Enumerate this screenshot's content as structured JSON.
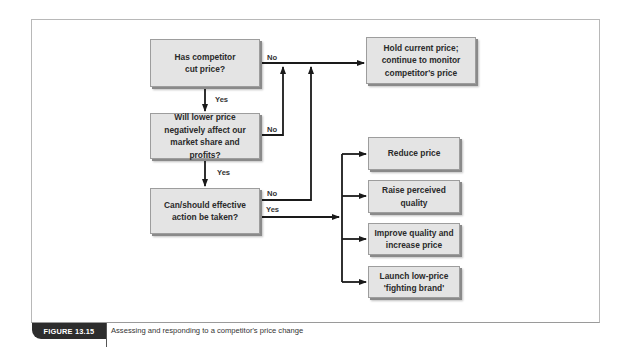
{
  "figure": {
    "label": "FIGURE 13.15",
    "caption": "Assessing and responding to a competitor's price change"
  },
  "nodes": {
    "q1": "Has competitor cut price?",
    "q2": "Will lower price negatively affect our market share and profits?",
    "q3": "Can/should effective action be taken?",
    "hold": "Hold current price; continue to monitor competitor's price",
    "reduce": "Reduce price",
    "raise": "Raise perceived quality",
    "improve": "Improve quality and increase price",
    "launch": "Launch low-price 'fighting brand'"
  },
  "edge_labels": {
    "q1_no": "No",
    "q1_yes": "Yes",
    "q2_no": "No",
    "q2_yes": "Yes",
    "q3_no": "No",
    "q3_yes": "Yes"
  },
  "colors": {
    "box_fill": "#e4e4e4",
    "line": "#1a1a1a",
    "tag_bg": "#2d2d2d"
  }
}
